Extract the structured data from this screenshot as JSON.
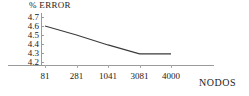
{
  "chart_data": {
    "type": "line",
    "title": "",
    "ylabel": "% ERROR",
    "xlabel": "NODOS",
    "categories": [
      "81",
      "281",
      "1041",
      "3081",
      "4000"
    ],
    "values": [
      4.6,
      4.5,
      4.39,
      4.29,
      4.29
    ],
    "series": [
      {
        "name": "% ERROR",
        "values": [
          4.6,
          4.5,
          4.39,
          4.29,
          4.29
        ]
      }
    ],
    "ylim": [
      4.2,
      4.7
    ],
    "ytick_labels": [
      "4.7",
      "4.6",
      "4.5",
      "4.4",
      "4.3",
      "4.2"
    ],
    "ytick_values": [
      4.7,
      4.6,
      4.5,
      4.4,
      4.3,
      4.2
    ],
    "xtick_labels": [
      "81",
      "281",
      "1041",
      "3081",
      "4000"
    ],
    "grid": false,
    "legend": "none",
    "line_color": "#3a3a3a",
    "axis_color": "#9a9a9a",
    "background": "#ffffff"
  }
}
